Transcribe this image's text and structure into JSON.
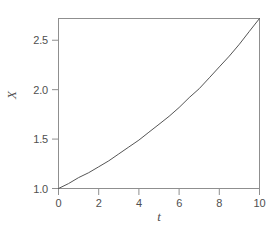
{
  "chart_data": {
    "type": "line",
    "title": "",
    "subtitle": "",
    "xlabel": "t",
    "ylabel": "X",
    "xlim": [
      0,
      10
    ],
    "ylim": [
      1.0,
      2.72
    ],
    "xticks": [
      0,
      2,
      4,
      6,
      8,
      10
    ],
    "xtick_labels": [
      "0",
      "2",
      "4",
      "6",
      "8",
      "10"
    ],
    "yticks": [
      1.0,
      1.5,
      2.0,
      2.5
    ],
    "ytick_labels": [
      "1.0",
      "1.5",
      "2.0",
      "2.5"
    ],
    "grid": false,
    "legend": null,
    "frame": "box",
    "series": [
      {
        "name": "X(t)",
        "color": "#555555",
        "linewidth": 1,
        "x": [
          0,
          0.5,
          1,
          1.5,
          2,
          2.5,
          3,
          3.5,
          4,
          4.5,
          5,
          5.5,
          6,
          6.5,
          7,
          7.5,
          8,
          8.5,
          9,
          9.5,
          10
        ],
        "values": [
          1.0,
          1.05,
          1.11,
          1.16,
          1.22,
          1.28,
          1.35,
          1.42,
          1.49,
          1.57,
          1.65,
          1.73,
          1.82,
          1.92,
          2.01,
          2.12,
          2.23,
          2.34,
          2.46,
          2.59,
          2.72
        ]
      }
    ],
    "annotations": []
  },
  "figure": {
    "background_color": "#ffffff",
    "axis_color": "#8a8a8a",
    "text_color": "#4f4f4f"
  }
}
